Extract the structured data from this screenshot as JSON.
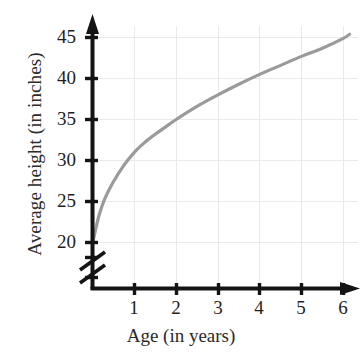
{
  "chart_data": {
    "type": "line",
    "title": "",
    "xlabel": "Age (in years)",
    "ylabel": "Average height (in inches)",
    "xlim": [
      0,
      6.3
    ],
    "ylim": [
      18.5,
      46.5
    ],
    "xticks": [
      1,
      2,
      3,
      4,
      5,
      6
    ],
    "yticks": [
      20,
      25,
      30,
      35,
      40,
      45
    ],
    "xtick_labels": [
      "1",
      "2",
      "3",
      "4",
      "5",
      "6"
    ],
    "ytick_labels": [
      "20",
      "25",
      "30",
      "35",
      "40",
      "45"
    ],
    "grid": true,
    "grid_color": "#e8e8ec",
    "y_axis_break": true,
    "y_axis_break_note": "zig-zag break between origin and 20",
    "axis_color": "#1a1a1a",
    "curve_color": "#9a9a9a",
    "legend": null,
    "series": [
      {
        "name": "Average height",
        "x": [
          0.02,
          0.15,
          0.3,
          0.5,
          0.75,
          1.0,
          1.25,
          1.5,
          1.75,
          2.0,
          2.5,
          3.0,
          3.5,
          4.0,
          4.5,
          5.0,
          5.5,
          6.0,
          6.15
        ],
        "values": [
          20.3,
          23.2,
          25.4,
          27.4,
          29.4,
          31.0,
          32.2,
          33.2,
          34.1,
          35.0,
          36.6,
          38.0,
          39.3,
          40.5,
          41.6,
          42.7,
          43.7,
          44.9,
          45.4
        ]
      }
    ]
  },
  "axis_titles": {
    "y": "Average height (in inches)",
    "x": "Age (in years)"
  }
}
